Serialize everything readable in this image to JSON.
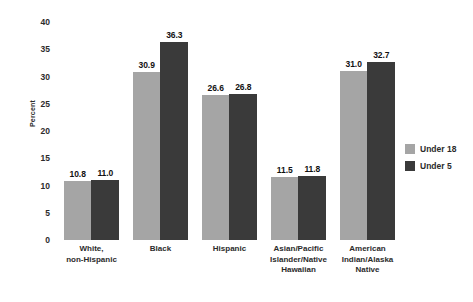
{
  "chart_data": {
    "type": "bar",
    "title": "",
    "xlabel": "",
    "ylabel": "Percent",
    "ylim": [
      0,
      40
    ],
    "ytick_step": 5,
    "yticks": [
      "40",
      "35",
      "30",
      "25",
      "20",
      "15",
      "10",
      "5",
      "0"
    ],
    "grid": false,
    "legend_position": "right",
    "categories": [
      "White,\nnon-Hispanic",
      "Black",
      "Hispanic",
      "Asian/Pacific\nIslander/Native\nHawaiian",
      "American\nIndian/Alaska\nNative"
    ],
    "category_lines": [
      [
        "White,",
        "non-Hispanic"
      ],
      [
        "Black"
      ],
      [
        "Hispanic"
      ],
      [
        "Asian/Pacific",
        "Islander/Native",
        "Hawaiian"
      ],
      [
        "American",
        "Indian/Alaska",
        "Native"
      ]
    ],
    "series": [
      {
        "name": "Under 18",
        "color": "#a5a5a5",
        "values": [
          10.8,
          30.9,
          26.6,
          11.5,
          31.0
        ],
        "labels": [
          "10.8",
          "30.9",
          "26.6",
          "11.5",
          "31.0"
        ]
      },
      {
        "name": "Under 5",
        "color": "#3a3a3a",
        "values": [
          11.0,
          36.3,
          26.8,
          11.8,
          32.7
        ],
        "labels": [
          "11.0",
          "36.3",
          "26.8",
          "11.8",
          "32.7"
        ]
      }
    ]
  },
  "legend": {
    "items": [
      {
        "label": "Under 18",
        "color": "#a5a5a5"
      },
      {
        "label": "Under 5",
        "color": "#3a3a3a"
      }
    ]
  },
  "axis": {
    "y_title": "Percent"
  }
}
